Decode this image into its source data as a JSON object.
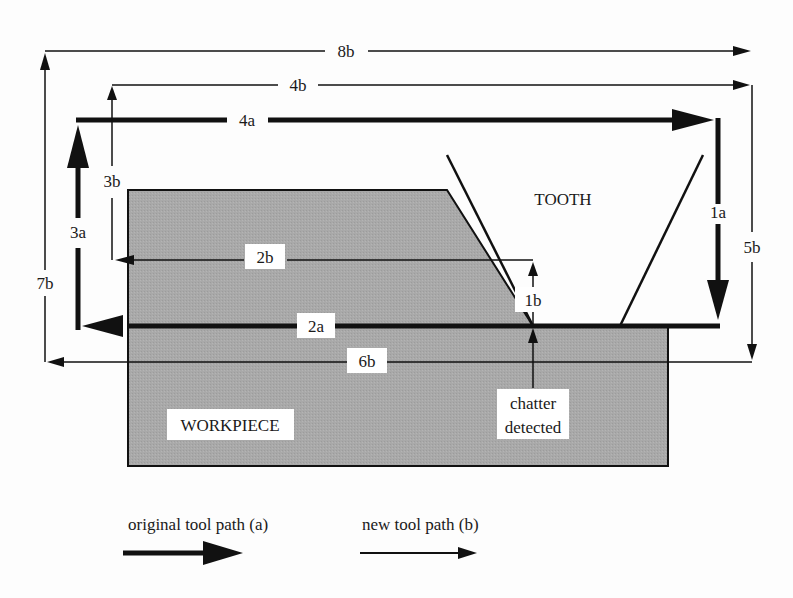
{
  "diagram": {
    "title": "",
    "regions": {
      "workpiece": {
        "label": "WORKPIECE",
        "fill": "#a9a9a9"
      },
      "tooth": {
        "label": "TOOTH"
      }
    },
    "annotation": {
      "line1": "chatter",
      "line2": "detected"
    },
    "path_labels": {
      "p1a": "1a",
      "p2a": "2a",
      "p3a": "3a",
      "p4a": "4a",
      "p1b": "1b",
      "p2b": "2b",
      "p3b": "3b",
      "p4b": "4b",
      "p5b": "5b",
      "p6b": "6b",
      "p7b": "7b",
      "p8b": "8b"
    },
    "legend": {
      "original": "original tool path (a)",
      "new": "new tool path (b)"
    },
    "colors": {
      "ink": "#111111",
      "workpiece": "#a9a9a9",
      "background": "#fdfdfd"
    }
  }
}
